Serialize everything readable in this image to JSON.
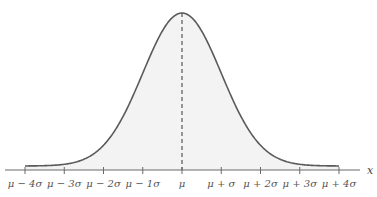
{
  "chart_data": {
    "type": "area",
    "title": "",
    "subtitle": "",
    "xlabel": "x",
    "ylabel": "",
    "distribution": "normal",
    "categories": [
      "μ − 4σ",
      "μ − 3σ",
      "μ − 2σ",
      "μ − 1σ",
      "μ",
      "μ + σ",
      "μ + 2σ",
      "μ + 3σ",
      "μ + 4σ"
    ],
    "x": [
      -4,
      -3,
      -2,
      -1,
      0,
      1,
      2,
      3,
      4
    ],
    "values": [
      0.0001,
      0.0044,
      0.054,
      0.242,
      0.3989,
      0.242,
      0.054,
      0.0044,
      0.0001
    ],
    "xlim": [
      -4,
      4
    ],
    "ylim": [
      0,
      0.4
    ],
    "mean_marker": {
      "x": 0,
      "style": "dashed"
    },
    "grid": false,
    "legend": null,
    "colors": {
      "curve": "#5a5a5a",
      "fill": "#f3f3f3",
      "axis": "#6a6a6a",
      "mean_line": "#555555"
    }
  }
}
